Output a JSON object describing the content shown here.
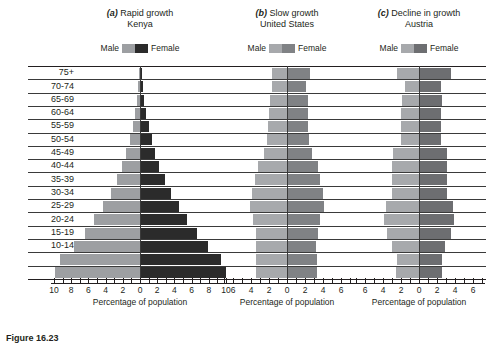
{
  "figure": {
    "caption_prefix": "Figure",
    "caption_number": "16.23",
    "caption_text": "Figure  16.23  Population pyramids"
  },
  "axis": {
    "title": "Percentage of population",
    "age_label_header": "Age",
    "age_groups": [
      "75+",
      "70-74",
      "65-69",
      "60-64",
      "55-59",
      "50-54",
      "45-49",
      "40-44",
      "35-39",
      "30-34",
      "25-29",
      "20-24",
      "15-19",
      "10-14",
      "5-9",
      "0-4"
    ]
  },
  "legend": {
    "male_label": "Male",
    "female_label": "Female"
  },
  "colors": {
    "male_dark_panel": "#9d9fa2",
    "female_dark_panel": "#2b2b2b",
    "male_mid_panel": "#a7a9ac",
    "female_mid_panel": "#808285",
    "male_light_panel": "#a7a9ac",
    "female_light_panel": "#6d6e71",
    "gridline": "#231f20",
    "axis": "#231f20",
    "text": "#231f20"
  },
  "chart_data": [
    {
      "type": "bar",
      "chart_kind": "population-pyramid",
      "panel": "a",
      "panel_letter": "(a)",
      "title": "Rapid growth",
      "subtitle": "Kenya",
      "xlabel": "Percentage of population",
      "ylabel": "Age",
      "xlim": [
        -10,
        10
      ],
      "xticks": [
        10,
        8,
        6,
        4,
        2,
        0,
        2,
        4,
        6,
        8,
        10
      ],
      "xtick_labels": [
        "10",
        "8",
        "6",
        "4",
        "2",
        "0",
        "2",
        "4",
        "6",
        "8",
        "10"
      ],
      "minor_tick_step": 1,
      "grid": true,
      "legend_position": "above-plot",
      "categories": [
        "75+",
        "70-74",
        "65-69",
        "60-64",
        "55-59",
        "50-54",
        "45-49",
        "40-44",
        "35-39",
        "30-34",
        "25-29",
        "20-24",
        "15-19",
        "10-14",
        "5-9",
        "0-4"
      ],
      "series": [
        {
          "name": "Male",
          "values": [
            0.15,
            0.25,
            0.4,
            0.6,
            0.85,
            1.2,
            1.6,
            2.1,
            2.7,
            3.4,
            4.3,
            5.3,
            6.4,
            7.7,
            9.3,
            9.9
          ]
        },
        {
          "name": "Female",
          "values": [
            0.2,
            0.3,
            0.5,
            0.7,
            1.0,
            1.35,
            1.75,
            2.25,
            2.85,
            3.6,
            4.5,
            5.5,
            6.6,
            7.9,
            9.4,
            10.0
          ]
        }
      ]
    },
    {
      "type": "bar",
      "chart_kind": "population-pyramid",
      "panel": "b",
      "panel_letter": "(b)",
      "title": "Slow growth",
      "subtitle": "United States",
      "xlabel": "Percentage of population",
      "ylabel": "Age",
      "xlim": [
        -7,
        7
      ],
      "xticks": [
        6,
        4,
        2,
        0,
        2,
        4,
        6
      ],
      "xtick_labels": [
        "6",
        "4",
        "2",
        "0",
        "2",
        "4",
        "6"
      ],
      "minor_tick_step": 1,
      "grid": true,
      "legend_position": "above-plot",
      "categories": [
        "75+",
        "70-74",
        "65-69",
        "60-64",
        "55-59",
        "50-54",
        "45-49",
        "40-44",
        "35-39",
        "30-34",
        "25-29",
        "20-24",
        "15-19",
        "10-14",
        "5-9",
        "0-4"
      ],
      "series": [
        {
          "name": "Male",
          "values": [
            1.7,
            1.7,
            1.9,
            2.0,
            2.1,
            2.2,
            2.6,
            3.2,
            3.6,
            3.9,
            4.1,
            3.8,
            3.5,
            3.4,
            3.5,
            3.5
          ]
        },
        {
          "name": "Female",
          "values": [
            2.6,
            2.1,
            2.3,
            2.3,
            2.3,
            2.4,
            2.8,
            3.4,
            3.7,
            4.0,
            4.1,
            3.7,
            3.4,
            3.2,
            3.3,
            3.3
          ]
        }
      ]
    },
    {
      "type": "bar",
      "chart_kind": "population-pyramid",
      "panel": "c",
      "panel_letter": "(c)",
      "title": "Decline in growth",
      "subtitle": "Austria",
      "xlabel": "Percentage of population",
      "ylabel": "Age",
      "xlim": [
        -7,
        7
      ],
      "xticks": [
        6,
        4,
        2,
        0,
        2,
        4,
        6
      ],
      "xtick_labels": [
        "6",
        "4",
        "2",
        "0",
        "2",
        "4",
        "6"
      ],
      "minor_tick_step": 1,
      "grid": true,
      "legend_position": "above-plot",
      "categories": [
        "75+",
        "70-74",
        "65-69",
        "60-64",
        "55-59",
        "50-54",
        "45-49",
        "40-44",
        "35-39",
        "30-34",
        "25-29",
        "20-24",
        "15-19",
        "10-14",
        "5-9",
        "0-4"
      ],
      "series": [
        {
          "name": "Male",
          "values": [
            2.4,
            1.6,
            1.9,
            2.0,
            2.0,
            2.0,
            2.9,
            3.0,
            3.0,
            3.0,
            3.7,
            3.9,
            3.6,
            3.0,
            2.5,
            2.6
          ]
        },
        {
          "name": "Female",
          "values": [
            3.6,
            2.4,
            2.5,
            2.4,
            2.4,
            2.4,
            3.1,
            3.1,
            3.1,
            3.1,
            3.8,
            3.9,
            3.5,
            2.9,
            2.5,
            2.6
          ]
        }
      ]
    }
  ]
}
